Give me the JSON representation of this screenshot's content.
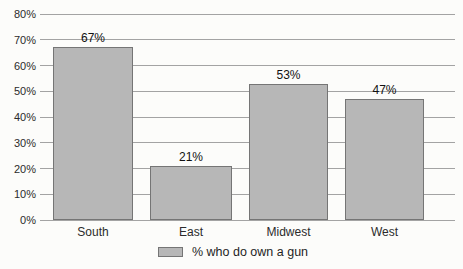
{
  "chart_data": {
    "type": "bar",
    "categories": [
      "South",
      "East",
      "Midwest",
      "West"
    ],
    "values": [
      67,
      21,
      53,
      47
    ],
    "value_labels": [
      "67%",
      "21%",
      "53%",
      "47%"
    ],
    "title": "",
    "xlabel": "",
    "ylabel": "",
    "ylim": [
      0,
      80
    ],
    "ytick_step": 10,
    "ytick_labels": [
      "0%",
      "10%",
      "20%",
      "30%",
      "40%",
      "50%",
      "60%",
      "70%",
      "80%"
    ],
    "grid": true,
    "legend": {
      "label": "% who do own a gun",
      "position": "bottom"
    },
    "colors": {
      "bar_fill": "#b7b7b7",
      "bar_border": "#757575",
      "gridline": "#a3a3a3",
      "text": "#262626",
      "background": "#fcfcfa"
    }
  }
}
